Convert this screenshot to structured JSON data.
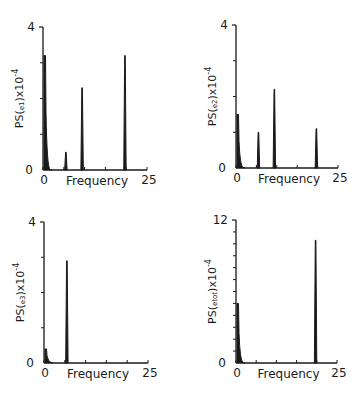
{
  "chart_data": [
    {
      "type": "line",
      "panel": "top-left",
      "title": "",
      "xlabel": "Frequency",
      "ylabel": "PS(e1)x10^-4",
      "ylabel_main": "PS(",
      "ylabel_sub": "e1",
      "ylabel_tail": ")x10",
      "ylabel_exp": "-4",
      "xlim": [
        0,
        25
      ],
      "ylim": [
        0,
        4
      ],
      "x_tick_labels": [
        "0",
        "25"
      ],
      "y_tick_labels": [
        "0",
        "4"
      ],
      "x_minor_ticks": [
        5,
        10,
        15,
        20
      ],
      "y_minor_ticks": [
        1,
        2,
        3
      ],
      "peaks": [
        {
          "x": 0.0,
          "y": 3.2,
          "width": 0.6
        },
        {
          "x": 5.5,
          "y": 0.5,
          "width": 0.2
        },
        {
          "x": 9.4,
          "y": 2.3,
          "width": 0.2
        },
        {
          "x": 19.7,
          "y": 3.2,
          "width": 0.2
        }
      ]
    },
    {
      "type": "line",
      "panel": "top-right",
      "title": "",
      "xlabel": "Frequency",
      "ylabel": "PS(e2)x10^-4",
      "ylabel_main": "PS(",
      "ylabel_sub": "e2",
      "ylabel_tail": ")x10",
      "ylabel_exp": "-4",
      "xlim": [
        0,
        25
      ],
      "ylim": [
        0,
        4
      ],
      "x_tick_labels": [
        "0",
        "25"
      ],
      "y_tick_labels": [
        "0",
        "4"
      ],
      "x_minor_ticks": [
        5,
        10,
        15,
        20
      ],
      "y_minor_ticks": [
        1,
        2,
        3
      ],
      "peaks": [
        {
          "x": 0.0,
          "y": 1.5,
          "width": 0.6
        },
        {
          "x": 5.5,
          "y": 1.0,
          "width": 0.2
        },
        {
          "x": 9.4,
          "y": 2.2,
          "width": 0.2
        },
        {
          "x": 19.7,
          "y": 1.1,
          "width": 0.2
        }
      ]
    },
    {
      "type": "line",
      "panel": "bottom-left",
      "title": "",
      "xlabel": "Frequency",
      "ylabel": "PS(e3)x10^-4",
      "ylabel_main": "PS(",
      "ylabel_sub": "e3",
      "ylabel_tail": ")x10",
      "ylabel_exp": "-4",
      "xlim": [
        0,
        25
      ],
      "ylim": [
        0,
        4
      ],
      "x_tick_labels": [
        "0",
        "25"
      ],
      "y_tick_labels": [
        "0",
        "4"
      ],
      "x_minor_ticks": [
        5,
        10,
        15,
        20
      ],
      "y_minor_ticks": [
        1,
        2,
        3
      ],
      "peaks": [
        {
          "x": 0.0,
          "y": 0.4,
          "width": 0.4
        },
        {
          "x": 5.5,
          "y": 2.9,
          "width": 0.2
        }
      ]
    },
    {
      "type": "line",
      "panel": "bottom-right",
      "title": "",
      "xlabel": "Frequency",
      "ylabel": "PS(etot)x10^-4",
      "ylabel_main": "PS(",
      "ylabel_sub": "etot",
      "ylabel_tail": ")x10",
      "ylabel_exp": "-4",
      "xlim": [
        0,
        25
      ],
      "ylim": [
        0,
        12
      ],
      "x_tick_labels": [
        "0",
        "25"
      ],
      "y_tick_labels": [
        "0",
        "12"
      ],
      "x_minor_ticks": [
        5,
        10,
        15,
        20
      ],
      "y_minor_ticks": [
        1,
        2,
        3,
        4,
        5,
        6,
        7,
        8,
        9,
        10,
        11
      ],
      "peaks": [
        {
          "x": 0.0,
          "y": 5.0,
          "width": 0.6
        },
        {
          "x": 19.7,
          "y": 10.3,
          "width": 0.2
        }
      ]
    }
  ],
  "colors": {
    "ink": "#1a1a1a",
    "background": "#ffffff"
  }
}
